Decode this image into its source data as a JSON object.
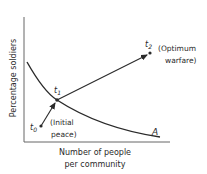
{
  "diagram": {
    "y_axis_label": "Percentage soldiers",
    "x_axis_label_line1": "Number of people",
    "x_axis_label_line2": "per community",
    "curve_label": "A",
    "points": {
      "t0": {
        "symbol": "t",
        "sub": "0",
        "note_line1": "(Initial",
        "note_line2": "peace)"
      },
      "t1": {
        "symbol": "t",
        "sub": "1"
      },
      "t2": {
        "symbol": "t",
        "sub": "2",
        "note_line1": "(Optimum",
        "note_line2": "warfare)"
      }
    },
    "colors": {
      "ink": "#2a2a2a",
      "axis": "#555555"
    }
  }
}
